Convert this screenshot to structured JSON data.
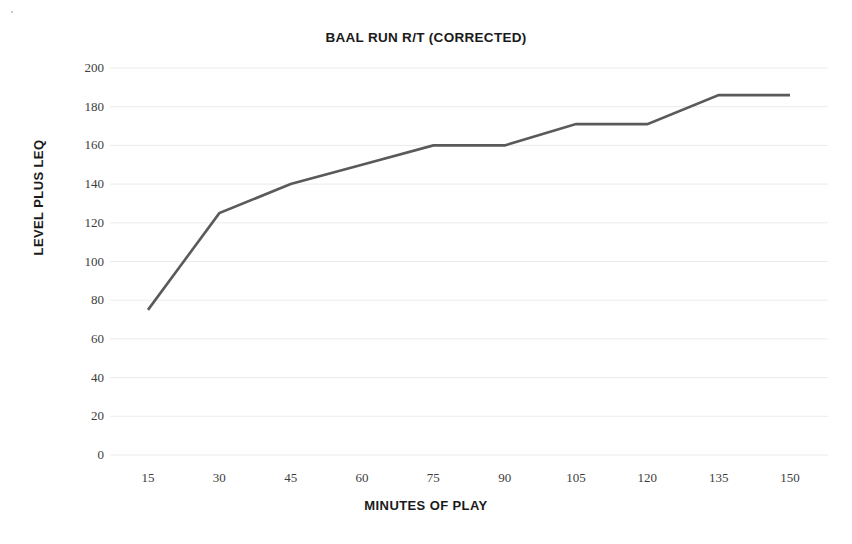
{
  "chart_data": {
    "type": "line",
    "title": "BAAL RUN R/T (CORRECTED)",
    "xlabel": "MINUTES OF PLAY",
    "ylabel": "LEVEL PLUS LEQ",
    "categories": [
      15,
      30,
      45,
      60,
      75,
      90,
      105,
      120,
      135,
      150
    ],
    "values": [
      75,
      125,
      140,
      150,
      160,
      160,
      171,
      171,
      186,
      186
    ],
    "x_tick_labels": [
      "15",
      "30",
      "45",
      "60",
      "75",
      "90",
      "105",
      "120",
      "135",
      "150"
    ],
    "y_tick_labels": [
      "200",
      "180",
      "160",
      "140",
      "120",
      "100",
      "80",
      "60",
      "40",
      "20",
      "0"
    ],
    "y_ticks": [
      200,
      180,
      160,
      140,
      120,
      100,
      80,
      60,
      40,
      20,
      0
    ],
    "ylim": [
      0,
      200
    ],
    "xlim": [
      15,
      150
    ],
    "grid": "horizontal",
    "legend": "none",
    "series": [
      {
        "name": "Level plus Leq",
        "values": [
          75,
          125,
          140,
          150,
          160,
          160,
          171,
          171,
          186,
          186
        ],
        "color": "#5a5a5a",
        "line_width": 2.6,
        "markers": false
      }
    ],
    "colors": {
      "line": "#5a5a5a",
      "grid": "#ebebeb",
      "text": "#1a1a1a",
      "tick_text": "#3d3d3d",
      "background": "#ffffff"
    }
  }
}
